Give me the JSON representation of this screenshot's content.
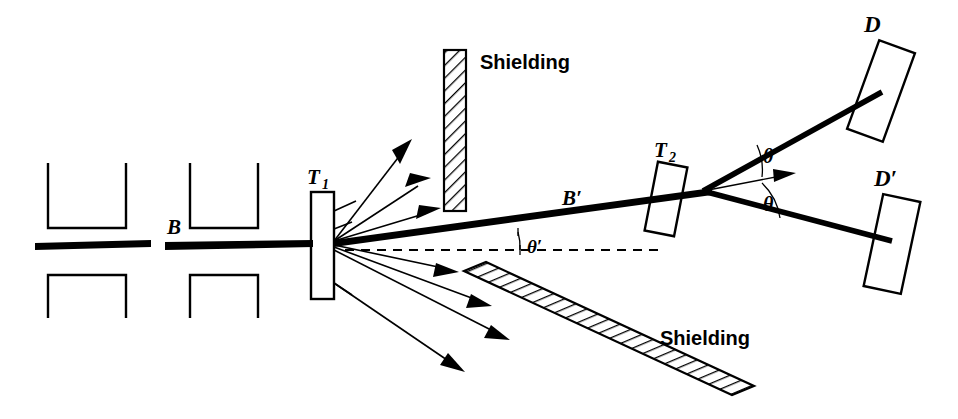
{
  "figure": {
    "type": "double-scattering-experiment-schematic",
    "background_color": "#ffffff",
    "ink_color": "#000000"
  },
  "labels": {
    "beam_incident": "B",
    "beam_scattered": "B′",
    "target_1": "T",
    "target_1_sub": "1",
    "target_2": "T",
    "target_2_sub": "2",
    "detector_1": "D",
    "detector_2": "D′",
    "angle_theta_upper": "θ",
    "angle_theta_lower": "θ",
    "angle_theta_prime": "θ′",
    "shielding_vertical": "Shielding",
    "shielding_diagonal": "Shielding"
  },
  "components": {
    "collimator_blocks": [
      {
        "name": "collimator-1-upper",
        "shape": "u-channel-open-top"
      },
      {
        "name": "collimator-1-lower",
        "shape": "u-channel-open-bottom"
      },
      {
        "name": "collimator-2-upper",
        "shape": "u-channel-open-top"
      },
      {
        "name": "collimator-2-lower",
        "shape": "u-channel-open-bottom"
      }
    ],
    "targets": [
      {
        "name": "target-T1",
        "label": "T1",
        "orientation": "vertical"
      },
      {
        "name": "target-T2",
        "label": "T2",
        "orientation": "tilted"
      }
    ],
    "detectors": [
      {
        "name": "detector-D",
        "label": "D",
        "orientation": "tilted"
      },
      {
        "name": "detector-D-prime",
        "label": "D′",
        "orientation": "tilted"
      }
    ],
    "shields": [
      {
        "name": "shielding-vertical",
        "label": "Shielding",
        "hatch": "diagonal"
      },
      {
        "name": "shielding-diagonal",
        "label": "Shielding",
        "hatch": "diagonal"
      }
    ],
    "scattered_rays_up": 3,
    "scattered_rays_down": 4
  }
}
